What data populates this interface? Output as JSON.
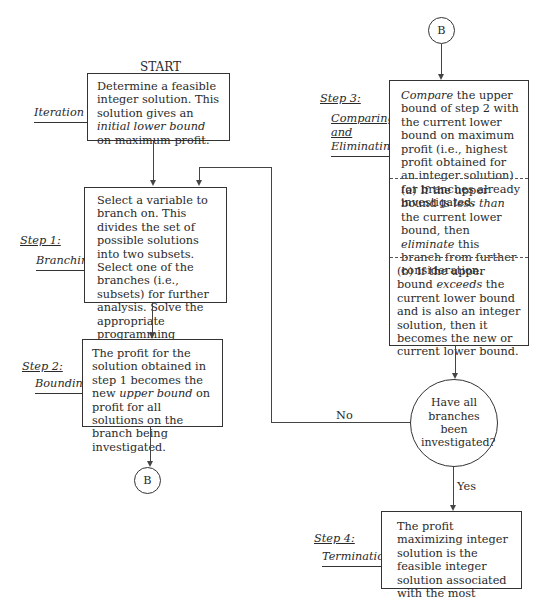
{
  "start_label": "START",
  "connector_label": "B",
  "steps": {
    "iteration0": {
      "label": "Iteration 0",
      "text_parts": [
        "Determine a feasible integer solution.  This solution gives an ",
        "initial lower bound",
        " on maximum profit."
      ]
    },
    "step1": {
      "label_step": "Step 1:",
      "label_name": "Branching",
      "text": "Select a variable to branch on.  This divides the set of possible solutions into two subsets.  Select one of the branches (i.e., subsets) for further analysis. Solve the appropriate programming problem."
    },
    "step2": {
      "label_step": "Step 2:",
      "label_name": "Bounding",
      "text_parts": [
        "The profit for the solution obtained in step 1 becomes the new ",
        "upper bound",
        " on profit for all solutions on the branch being investigated."
      ]
    },
    "step3": {
      "label_step": "Step 3:",
      "label_name_1": "Comparing",
      "label_name_2": "and",
      "label_name_3": "Eliminating",
      "intro_parts": [
        "Compare",
        " the upper bound of step 2 with the current lower bound on maximum profit (i.e., highest profit obtained for an integer solution) for branches already investigated."
      ],
      "case_a_parts": [
        "(a)  If the upper bound is ",
        "less than",
        " the current lower bound, then ",
        "eliminate",
        " this branch from further consideration."
      ],
      "case_b_parts": [
        "(b)  If the upper bound ",
        "exceeds",
        " the current lower bound and is also an integer solution, then it becomes the new or current lower bound."
      ]
    },
    "decision": {
      "question": "Have all branches been investigated?",
      "no_label": "No",
      "yes_label": "Yes"
    },
    "step4": {
      "label_step": "Step 4:",
      "label_name": "Termination",
      "text": "The profit maximizing integer solution is the feasible integer solution associated with the most current lower bound."
    }
  }
}
